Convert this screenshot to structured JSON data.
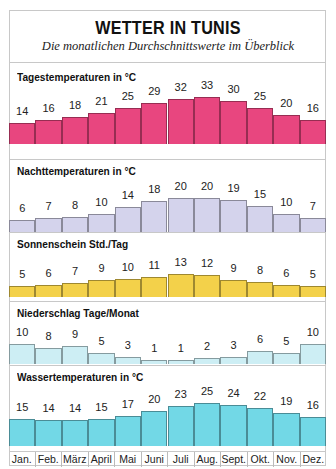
{
  "header": {
    "title": "WETTER IN TUNIS",
    "subtitle": "Die monatlichen Durchschnittswerte im Überblick"
  },
  "months": [
    "Jan.",
    "Feb.",
    "März",
    "April",
    "Mai",
    "Juni",
    "Juli",
    "Aug.",
    "Sept.",
    "Okt.",
    "Nov.",
    "Dez."
  ],
  "panels": [
    {
      "label": "Tagestemperaturen in °C",
      "color": "#e8467f",
      "values": [
        14,
        16,
        18,
        21,
        25,
        29,
        32,
        33,
        30,
        25,
        20,
        16
      ]
    },
    {
      "label": "Nachttemperaturen in °C",
      "color": "#d4d3ec",
      "values": [
        6,
        7,
        8,
        10,
        14,
        18,
        20,
        20,
        19,
        15,
        10,
        7
      ]
    },
    {
      "label": "Sonnenschein Std./Tag",
      "color": "#f3d14a",
      "values": [
        5,
        6,
        7,
        9,
        10,
        11,
        13,
        12,
        9,
        8,
        6,
        5
      ]
    },
    {
      "label": "Niederschlag Tage/Monat",
      "color": "#cdeef4",
      "values": [
        10,
        8,
        9,
        5,
        3,
        1,
        1,
        2,
        3,
        6,
        5,
        10
      ]
    },
    {
      "label": "Wassertemperaturen in °C",
      "color": "#72d8e6",
      "values": [
        15,
        14,
        14,
        15,
        17,
        20,
        23,
        25,
        24,
        22,
        19,
        16
      ]
    }
  ],
  "chart_data": [
    {
      "type": "bar",
      "title": "Tagestemperaturen in °C",
      "categories": [
        "Jan.",
        "Feb.",
        "März",
        "April",
        "Mai",
        "Juni",
        "Juli",
        "Aug.",
        "Sept.",
        "Okt.",
        "Nov.",
        "Dez."
      ],
      "values": [
        14,
        16,
        18,
        21,
        25,
        29,
        32,
        33,
        30,
        25,
        20,
        16
      ],
      "ylabel": "°C"
    },
    {
      "type": "bar",
      "title": "Nachttemperaturen in °C",
      "categories": [
        "Jan.",
        "Feb.",
        "März",
        "April",
        "Mai",
        "Juni",
        "Juli",
        "Aug.",
        "Sept.",
        "Okt.",
        "Nov.",
        "Dez."
      ],
      "values": [
        6,
        7,
        8,
        10,
        14,
        18,
        20,
        20,
        19,
        15,
        10,
        7
      ],
      "ylabel": "°C"
    },
    {
      "type": "bar",
      "title": "Sonnenschein Std./Tag",
      "categories": [
        "Jan.",
        "Feb.",
        "März",
        "April",
        "Mai",
        "Juni",
        "Juli",
        "Aug.",
        "Sept.",
        "Okt.",
        "Nov.",
        "Dez."
      ],
      "values": [
        5,
        6,
        7,
        9,
        10,
        11,
        13,
        12,
        9,
        8,
        6,
        5
      ],
      "ylabel": "Std./Tag"
    },
    {
      "type": "bar",
      "title": "Niederschlag Tage/Monat",
      "categories": [
        "Jan.",
        "Feb.",
        "März",
        "April",
        "Mai",
        "Juni",
        "Juli",
        "Aug.",
        "Sept.",
        "Okt.",
        "Nov.",
        "Dez."
      ],
      "values": [
        10,
        8,
        9,
        5,
        3,
        1,
        1,
        2,
        3,
        6,
        5,
        10
      ],
      "ylabel": "Tage/Monat"
    },
    {
      "type": "bar",
      "title": "Wassertemperaturen in °C",
      "categories": [
        "Jan.",
        "Feb.",
        "März",
        "April",
        "Mai",
        "Juni",
        "Juli",
        "Aug.",
        "Sept.",
        "Okt.",
        "Nov.",
        "Dez."
      ],
      "values": [
        15,
        14,
        14,
        15,
        17,
        20,
        23,
        25,
        24,
        22,
        19,
        16
      ],
      "ylabel": "°C"
    }
  ]
}
